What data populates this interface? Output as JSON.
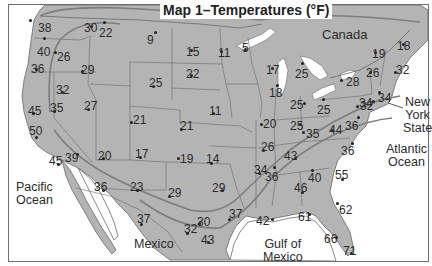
{
  "title": "Map 1–Temperatures (°F)",
  "unit": "°F",
  "regions": {
    "canada": "Canada",
    "pacific": [
      "Pacific",
      "Ocean"
    ],
    "atlantic": [
      "Atlantic",
      "Ocean"
    ],
    "gulf": [
      "Gulf of",
      "Mexico"
    ],
    "mexico": "Mexico",
    "nys": [
      "New",
      "York",
      "State"
    ]
  },
  "colors": {
    "land": "#b4b4b4",
    "water": "#ffffff",
    "border": "#6a6a6a",
    "isoline": "#7a7a7a"
  },
  "stations": [
    {
      "v": "38",
      "x": 38,
      "y": 22,
      "dx": 30,
      "dy": 20
    },
    {
      "v": "30",
      "x": 84,
      "y": 22,
      "dx": 91,
      "dy": 26
    },
    {
      "v": "22",
      "x": 99,
      "y": 27,
      "dx": 104,
      "dy": 22
    },
    {
      "v": "9",
      "x": 147,
      "y": 34,
      "dx": 155,
      "dy": 32
    },
    {
      "v": "40",
      "x": 37,
      "y": 46,
      "dx": 44,
      "dy": 38
    },
    {
      "v": "26",
      "x": 57,
      "y": 51,
      "dx": 55,
      "dy": 52
    },
    {
      "v": "15",
      "x": 186,
      "y": 46,
      "dx": 191,
      "dy": 50
    },
    {
      "v": "11",
      "x": 218,
      "y": 47,
      "dx": 221,
      "dy": 51
    },
    {
      "v": "5",
      "x": 242,
      "y": 42,
      "dx": 245,
      "dy": 49
    },
    {
      "v": "17",
      "x": 266,
      "y": 64,
      "dx": 272,
      "dy": 68
    },
    {
      "v": "25",
      "x": 295,
      "y": 68,
      "dx": 302,
      "dy": 63
    },
    {
      "v": "19",
      "x": 372,
      "y": 48,
      "dx": 375,
      "dy": 52
    },
    {
      "v": "18",
      "x": 397,
      "y": 40,
      "dx": 403,
      "dy": 44
    },
    {
      "v": "36",
      "x": 31,
      "y": 63,
      "dx": 36,
      "dy": 69
    },
    {
      "v": "29",
      "x": 81,
      "y": 64,
      "dx": 82,
      "dy": 71
    },
    {
      "v": "25",
      "x": 149,
      "y": 77,
      "dx": 153,
      "dy": 86
    },
    {
      "v": "22",
      "x": 186,
      "y": 68,
      "dx": 191,
      "dy": 75
    },
    {
      "v": "26",
      "x": 366,
      "y": 67,
      "dx": 370,
      "dy": 72
    },
    {
      "v": "32",
      "x": 396,
      "y": 64,
      "dx": 395,
      "dy": 72
    },
    {
      "v": "28",
      "x": 346,
      "y": 76,
      "dx": 341,
      "dy": 80
    },
    {
      "v": "32",
      "x": 56,
      "y": 84,
      "dx": 62,
      "dy": 92
    },
    {
      "v": "45",
      "x": 28,
      "y": 105,
      "dx": 33,
      "dy": 113
    },
    {
      "v": "35",
      "x": 50,
      "y": 102,
      "dx": 54,
      "dy": 111
    },
    {
      "v": "27",
      "x": 84,
      "y": 100,
      "dx": 88,
      "dy": 109
    },
    {
      "v": "21",
      "x": 133,
      "y": 114,
      "dx": 131,
      "dy": 122
    },
    {
      "v": "11",
      "x": 209,
      "y": 105,
      "dx": 213,
      "dy": 113
    },
    {
      "v": "18",
      "x": 269,
      "y": 87,
      "dx": 277,
      "dy": 85
    },
    {
      "v": "25",
      "x": 290,
      "y": 99,
      "dx": 304,
      "dy": 103
    },
    {
      "v": "25",
      "x": 317,
      "y": 104,
      "dx": 323,
      "dy": 99
    },
    {
      "v": "32",
      "x": 360,
      "y": 100,
      "dx": 357,
      "dy": 106
    },
    {
      "v": "34",
      "x": 359,
      "y": 97,
      "dx": 373,
      "dy": 101
    },
    {
      "v": "34",
      "x": 378,
      "y": 92,
      "dx": 379,
      "dy": 92
    },
    {
      "v": "50",
      "x": 29,
      "y": 125,
      "dx": 36,
      "dy": 137
    },
    {
      "v": "21",
      "x": 180,
      "y": 120,
      "dx": 181,
      "dy": 129
    },
    {
      "v": "20",
      "x": 263,
      "y": 118,
      "dx": 261,
      "dy": 124
    },
    {
      "v": "25",
      "x": 290,
      "y": 120,
      "dx": 300,
      "dy": 124
    },
    {
      "v": "35",
      "x": 306,
      "y": 128,
      "dx": 303,
      "dy": 132
    },
    {
      "v": "44",
      "x": 329,
      "y": 124,
      "dx": 332,
      "dy": 130
    },
    {
      "v": "36",
      "x": 345,
      "y": 120,
      "dx": 358,
      "dy": 117
    },
    {
      "v": "45",
      "x": 49,
      "y": 155,
      "dx": 58,
      "dy": 164
    },
    {
      "v": "39",
      "x": 65,
      "y": 152,
      "dx": 77,
      "dy": 154
    },
    {
      "v": "20",
      "x": 98,
      "y": 150,
      "dx": 103,
      "dy": 158
    },
    {
      "v": "17",
      "x": 135,
      "y": 148,
      "dx": 140,
      "dy": 157
    },
    {
      "v": "19",
      "x": 180,
      "y": 153,
      "dx": 178,
      "dy": 158
    },
    {
      "v": "14",
      "x": 206,
      "y": 153,
      "dx": 211,
      "dy": 163
    },
    {
      "v": "26",
      "x": 261,
      "y": 141,
      "dx": 263,
      "dy": 150
    },
    {
      "v": "43",
      "x": 284,
      "y": 150,
      "dx": 295,
      "dy": 158
    },
    {
      "v": "36",
      "x": 341,
      "y": 145,
      "dx": 352,
      "dy": 143
    },
    {
      "v": "34",
      "x": 254,
      "y": 164,
      "dx": 259,
      "dy": 173
    },
    {
      "v": "36",
      "x": 265,
      "y": 171,
      "dx": 274,
      "dy": 167
    },
    {
      "v": "40",
      "x": 308,
      "y": 172,
      "dx": 312,
      "dy": 170
    },
    {
      "v": "55",
      "x": 335,
      "y": 169,
      "dx": 342,
      "dy": 179
    },
    {
      "v": "46",
      "x": 294,
      "y": 182,
      "dx": 302,
      "dy": 192
    },
    {
      "v": "36",
      "x": 94,
      "y": 181,
      "dx": 103,
      "dy": 190
    },
    {
      "v": "23",
      "x": 130,
      "y": 181,
      "dx": 137,
      "dy": 190
    },
    {
      "v": "29",
      "x": 168,
      "y": 187,
      "dx": 169,
      "dy": 196
    },
    {
      "v": "29",
      "x": 212,
      "y": 182,
      "dx": 222,
      "dy": 190
    },
    {
      "v": "62",
      "x": 339,
      "y": 204,
      "dx": 337,
      "dy": 203
    },
    {
      "v": "37",
      "x": 137,
      "y": 213,
      "dx": 141,
      "dy": 224
    },
    {
      "v": "30",
      "x": 197,
      "y": 216,
      "dx": 199,
      "dy": 223
    },
    {
      "v": "37",
      "x": 229,
      "y": 208,
      "dx": 229,
      "dy": 219
    },
    {
      "v": "42",
      "x": 256,
      "y": 215,
      "dx": 272,
      "dy": 219
    },
    {
      "v": "61",
      "x": 298,
      "y": 211,
      "dx": 309,
      "dy": 214
    },
    {
      "v": "32",
      "x": 184,
      "y": 223,
      "dx": 187,
      "dy": 233
    },
    {
      "v": "43",
      "x": 201,
      "y": 234,
      "dx": 208,
      "dy": 242
    },
    {
      "v": "66",
      "x": 324,
      "y": 233,
      "dx": 336,
      "dy": 237
    },
    {
      "v": "71",
      "x": 343,
      "y": 245,
      "dx": 351,
      "dy": 253
    }
  ]
}
